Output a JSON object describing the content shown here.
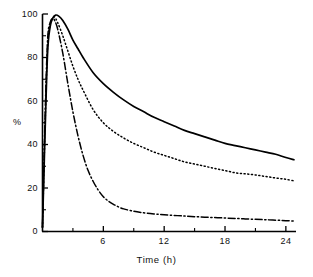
{
  "chart_data": {
    "type": "line",
    "title": "",
    "xlabel": "Time (h)",
    "ylabel": "%",
    "xlim": [
      0,
      25
    ],
    "ylim": [
      0,
      100
    ],
    "grid": false,
    "legend": null,
    "x_ticks": [
      "0",
      "6",
      "12",
      "18",
      "24"
    ],
    "x_tick_values": [
      0,
      6,
      12,
      18,
      24
    ],
    "x_minor_ticks": [
      3,
      9,
      15,
      21
    ],
    "y_ticks": [
      "0",
      "20",
      "40",
      "60",
      "80",
      "100"
    ],
    "y_tick_values": [
      0,
      20,
      40,
      60,
      80,
      100
    ],
    "y_minor_ticks": [
      10,
      30,
      50,
      70,
      90
    ],
    "series": [
      {
        "name": "solid-curve",
        "style": "solid",
        "color": "#000000",
        "x": [
          0,
          0.25,
          0.5,
          0.75,
          1.0,
          1.3,
          1.6,
          2.0,
          2.5,
          3.0,
          3.5,
          4.0,
          5.0,
          6.0,
          7.0,
          8.0,
          9.0,
          10.0,
          11.0,
          12.0,
          13.0,
          14.0,
          15.0,
          16.0,
          17.0,
          18.0,
          19.0,
          20.0,
          21.0,
          22.0,
          23.0,
          24.0,
          24.8
        ],
        "y": [
          2,
          45,
          82,
          94,
          98,
          99.5,
          99,
          97,
          93,
          88,
          84,
          80,
          73,
          68,
          64,
          60.5,
          57.5,
          55,
          52.5,
          50.5,
          48.5,
          46.5,
          45,
          43.5,
          42,
          40.5,
          39.5,
          38.5,
          37.5,
          36.5,
          35.5,
          34,
          33
        ]
      },
      {
        "name": "dotted-curve",
        "style": "dotted",
        "color": "#000000",
        "x": [
          0,
          0.25,
          0.5,
          0.75,
          1.0,
          1.2,
          1.5,
          2.0,
          2.5,
          3.0,
          3.5,
          4.0,
          5.0,
          6.0,
          7.0,
          8.0,
          9.0,
          10.0,
          11.0,
          12.0,
          13.0,
          14.0,
          15.0,
          16.0,
          17.0,
          18.0,
          19.0,
          20.0,
          21.0,
          22.0,
          23.0,
          24.0,
          24.8
        ],
        "y": [
          2,
          48,
          85,
          95,
          98,
          98.5,
          96,
          90,
          83,
          76,
          70,
          65,
          56,
          50,
          46,
          43,
          40.5,
          38.5,
          36.5,
          35,
          33.5,
          32,
          31,
          30,
          29,
          28,
          27,
          26.5,
          26,
          25.3,
          24.6,
          24,
          23.3
        ]
      },
      {
        "name": "dash-dot-curve",
        "style": "dashdot",
        "color": "#000000",
        "x": [
          0,
          0.25,
          0.5,
          0.75,
          1.0,
          1.2,
          1.5,
          2.0,
          2.5,
          3.0,
          3.5,
          4.0,
          4.5,
          5.0,
          5.5,
          6.0,
          6.5,
          7.0,
          7.5,
          8.0,
          9.0,
          10.0,
          11.0,
          12.0,
          14.0,
          16.0,
          18.0,
          20.0,
          22.0,
          24.0,
          24.8
        ],
        "y": [
          2,
          52,
          88,
          96,
          98,
          97,
          93,
          82,
          68,
          55,
          44,
          35,
          28,
          23,
          19,
          16,
          14,
          12.5,
          11.3,
          10.4,
          9.3,
          8.6,
          8.1,
          7.7,
          7.1,
          6.6,
          6.2,
          5.8,
          5.4,
          5.0,
          4.8
        ]
      }
    ]
  }
}
